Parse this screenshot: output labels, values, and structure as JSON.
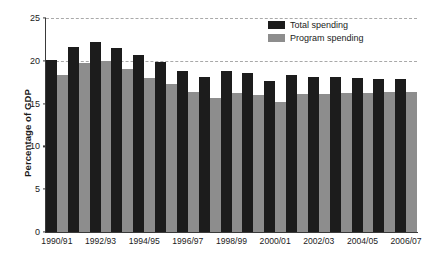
{
  "chart_data": {
    "type": "bar",
    "title": "",
    "xlabel": "",
    "ylabel": "Percentage of GDP",
    "ylim": [
      0,
      25
    ],
    "yticks": [
      0,
      5,
      10,
      15,
      20,
      25
    ],
    "grid": true,
    "legend_position": "top-right-inside",
    "categories": [
      "1990/91",
      "1991/92",
      "1992/93",
      "1993/94",
      "1994/95",
      "1995/96",
      "1996/97",
      "1997/98",
      "1998/99",
      "1999/00",
      "2000/01",
      "2001/02",
      "2002/03",
      "2003/04",
      "2004/05",
      "2005/06",
      "2006/07"
    ],
    "visible_tick_labels": [
      "1990/91",
      "1992/93",
      "1994/95",
      "1996/97",
      "1998/99",
      "2000/01",
      "2002/03",
      "2004/05",
      "2006/07"
    ],
    "series": [
      {
        "name": "Total spending",
        "color": "#1c1c1c",
        "values": [
          20.1,
          21.6,
          22.2,
          21.5,
          20.7,
          19.9,
          18.8,
          18.1,
          18.8,
          18.6,
          17.6,
          18.3,
          18.1,
          18.1,
          18.0,
          17.9,
          17.9
        ]
      },
      {
        "name": "Program spending",
        "color": "#8d8d8d",
        "values": [
          18.3,
          19.7,
          20.0,
          19.0,
          18.0,
          17.3,
          16.4,
          15.7,
          16.2,
          16.0,
          15.2,
          16.1,
          16.1,
          16.2,
          16.2,
          16.3,
          16.4
        ]
      }
    ]
  },
  "legend": {
    "items": [
      {
        "label": "Total spending"
      },
      {
        "label": "Program spending"
      }
    ]
  },
  "colors": {
    "total": "#1c1c1c",
    "program": "#8d8d8d",
    "axis": "#3a3a3a",
    "grid": "#a9a9a9",
    "background": "#ffffff"
  }
}
